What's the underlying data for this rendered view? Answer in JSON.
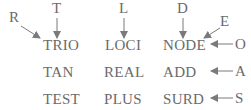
{
  "grid": {
    "rows": [
      [
        "TRIO",
        "LOCI",
        "NODE"
      ],
      [
        "TAN",
        "REAL",
        "ADD"
      ],
      [
        "TEST",
        "PLUS",
        "SURD"
      ]
    ]
  },
  "arrow_letters": {
    "R": "R",
    "T": "T",
    "L": "L",
    "D": "D",
    "E": "E",
    "O": "O",
    "A": "A",
    "S": "S"
  },
  "colors": {
    "text": "#6a6a6a",
    "arrow": "#7a7a7a",
    "background": "#ffffff"
  }
}
